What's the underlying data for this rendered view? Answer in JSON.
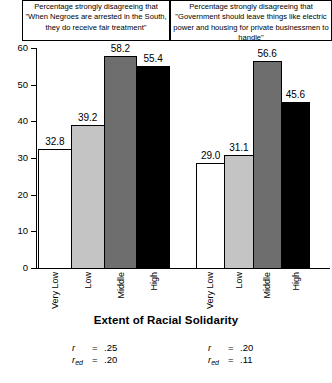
{
  "chart_data": {
    "type": "bar",
    "title": "",
    "xlabel": "Extent of Racial Solidarity",
    "ylabel": "",
    "ylim": [
      0,
      60
    ],
    "yticks": [
      0,
      10,
      20,
      30,
      40,
      50,
      60
    ],
    "ytick_labels": [
      "0",
      "10",
      "20",
      "30",
      "40",
      "50",
      "60"
    ],
    "grid": false,
    "legend": "none",
    "categories": [
      "Very Low",
      "Low",
      "Middle",
      "High"
    ],
    "bar_colors": [
      "#ffffff",
      "#c4c4c4",
      "#6e6e6e",
      "#000000"
    ],
    "panels": [
      {
        "title": "Percentage strongly disagreeing that \"When Negroes are arrested in the South, they do receive fair treatment\"",
        "categories": [
          "Very Low",
          "Low",
          "Middle",
          "High"
        ],
        "values": [
          32.8,
          39.2,
          58.2,
          55.4
        ],
        "value_labels": [
          "32.8",
          "39.2",
          "58.2",
          "55.4"
        ],
        "annotations": [
          {
            "symbol": "r",
            "subscript": "",
            "eq": "=",
            "value": ".25"
          },
          {
            "symbol": "r",
            "subscript": "ed",
            "eq": "=",
            "value": ".20"
          }
        ]
      },
      {
        "title": "Percentage strongly disagreeing that \"Government should leave things like electric power and housing for private businessmen to handle\"",
        "categories": [
          "Very Low",
          "Low",
          "Middle",
          "High"
        ],
        "values": [
          29.0,
          31.1,
          56.6,
          45.6
        ],
        "value_labels": [
          "29.0",
          "31.1",
          "56.6",
          "45.6"
        ],
        "annotations": [
          {
            "symbol": "r",
            "subscript": "",
            "eq": "=",
            "value": ".20"
          },
          {
            "symbol": "r",
            "subscript": "ed",
            "eq": "=",
            "value": ".11"
          }
        ]
      }
    ]
  }
}
